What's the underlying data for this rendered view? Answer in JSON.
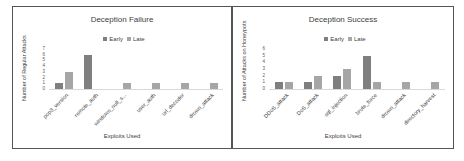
{
  "chart_data": [
    {
      "type": "bar",
      "title": "Deception Failure",
      "xlabel": "Exploits Used",
      "ylabel": "Number of Regular Attacks",
      "ylim": [
        0,
        7
      ],
      "yticks": [
        0,
        1,
        2,
        3,
        4,
        5,
        6,
        7
      ],
      "legend_position": "top",
      "grid": false,
      "categories": [
        "pop3_version",
        "remote_auth",
        "windows_null_s...",
        "user_auth",
        "url_decoder",
        "drown_attack"
      ],
      "series": [
        {
          "name": "Early",
          "color": "#7f7f7f",
          "values": [
            1,
            6,
            0,
            0,
            0,
            0
          ]
        },
        {
          "name": "Late",
          "color": "#a6a6a6",
          "values": [
            3,
            0,
            1,
            1,
            1,
            1
          ]
        }
      ]
    },
    {
      "type": "bar",
      "title": "Deception Success",
      "xlabel": "Exploits Used",
      "ylabel": "Number of Attacks on Honeypots",
      "ylim": [
        0,
        6
      ],
      "yticks": [
        0,
        1,
        2,
        3,
        4,
        5,
        6
      ],
      "legend_position": "top",
      "grid": false,
      "categories": [
        "DDoS_attack",
        "DoS_attack",
        "sql_injection",
        "brute_force",
        "drown_attack",
        "directory_harvest"
      ],
      "series": [
        {
          "name": "Early",
          "color": "#7f7f7f",
          "values": [
            1,
            1,
            2,
            5,
            0,
            0
          ]
        },
        {
          "name": "Late",
          "color": "#a6a6a6",
          "values": [
            1,
            2,
            3,
            1,
            1,
            1
          ]
        }
      ]
    }
  ]
}
